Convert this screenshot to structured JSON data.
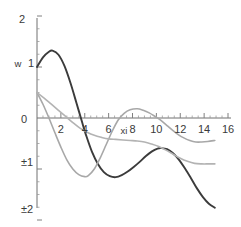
{
  "chart_data": {
    "type": "line",
    "title": "",
    "xlabel": "xi",
    "ylabel": "w",
    "xlim": [
      0,
      16.6
    ],
    "ylim": [
      -2.15,
      2.05
    ],
    "grid": false,
    "legend": "none",
    "xticks": [
      2,
      4,
      6,
      8,
      10,
      12,
      14,
      16
    ],
    "xtick_labels": [
      "2",
      "4",
      "6",
      "8",
      "10",
      "12",
      "14",
      "16"
    ],
    "yticks": [
      2,
      1,
      0,
      -1,
      -2
    ],
    "ytick_labels": [
      "2",
      "1",
      "0",
      "±1",
      "±2"
    ],
    "ytick_label_zero": "0",
    "ytick_label_one": "1",
    "ytick_label_two": "2",
    "ytick_label_minus_one": "±1",
    "ytick_label_minus_two": "±2",
    "series": [
      {
        "name": "dark-curve",
        "color": "#3b3b3b",
        "width": 1.9,
        "x": [
          0.0,
          0.5,
          1.0,
          1.3,
          1.8,
          2.3,
          2.8,
          3.3,
          3.8,
          4.1,
          4.6,
          5.1,
          5.6,
          6.1,
          6.6,
          7.1,
          7.6,
          8.1,
          8.6,
          9.1,
          9.6,
          10.1,
          10.4,
          10.9,
          11.4,
          11.9,
          12.4,
          12.9,
          13.4,
          13.9,
          14.4,
          14.9
        ],
        "y": [
          1.0,
          1.19,
          1.3,
          1.32,
          1.24,
          1.02,
          0.69,
          0.3,
          -0.1,
          -0.33,
          -0.66,
          -0.9,
          -1.06,
          -1.14,
          -1.16,
          -1.12,
          -1.05,
          -0.96,
          -0.86,
          -0.75,
          -0.66,
          -0.6,
          -0.59,
          -0.61,
          -0.69,
          -0.82,
          -0.99,
          -1.18,
          -1.38,
          -1.55,
          -1.68,
          -1.76
        ]
      },
      {
        "name": "gray-oscillating-curve",
        "color": "#a8a8a8",
        "width": 1.6,
        "x": [
          0.0,
          0.5,
          1.0,
          1.5,
          2.0,
          2.5,
          3.0,
          3.5,
          4.0,
          4.3,
          4.8,
          5.3,
          5.8,
          6.3,
          6.8,
          7.3,
          7.8,
          8.4,
          8.9,
          9.4,
          9.9,
          10.3,
          10.8,
          11.3,
          11.8,
          12.3,
          12.8,
          13.3,
          13.8,
          14.3,
          14.9
        ],
        "y": [
          0.5,
          0.27,
          0.0,
          -0.29,
          -0.57,
          -0.82,
          -1.0,
          -1.11,
          -1.15,
          -1.13,
          -1.0,
          -0.78,
          -0.52,
          -0.26,
          -0.04,
          0.09,
          0.16,
          0.18,
          0.15,
          0.1,
          0.03,
          -0.03,
          -0.13,
          -0.23,
          -0.32,
          -0.39,
          -0.44,
          -0.47,
          -0.47,
          -0.46,
          -0.44
        ]
      },
      {
        "name": "gray-monotone-curve",
        "color": "#b3b3b3",
        "width": 1.6,
        "x": [
          0.0,
          0.6,
          1.2,
          1.8,
          2.4,
          3.0,
          3.6,
          4.2,
          4.8,
          5.4,
          6.0,
          6.6,
          7.2,
          7.8,
          8.4,
          9.0,
          9.6,
          10.2,
          10.8,
          11.4,
          12.0,
          12.6,
          13.2,
          13.8,
          14.4,
          14.9
        ],
        "y": [
          0.5,
          0.39,
          0.27,
          0.15,
          0.03,
          -0.09,
          -0.2,
          -0.28,
          -0.34,
          -0.38,
          -0.41,
          -0.42,
          -0.43,
          -0.44,
          -0.45,
          -0.47,
          -0.51,
          -0.56,
          -0.63,
          -0.71,
          -0.79,
          -0.85,
          -0.89,
          -0.9,
          -0.9,
          -0.9
        ]
      }
    ]
  }
}
